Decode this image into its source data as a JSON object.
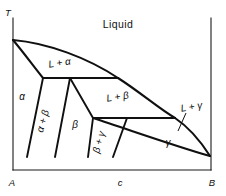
{
  "figure": {
    "kind": "binary-phase-diagram",
    "background_color": "#ffffff",
    "line_color": "#101010"
  },
  "axes": {
    "vertical_label": "T",
    "origin_label": "A",
    "right_label": "B",
    "mid_label": "c"
  },
  "regions": {
    "liquid": "Liquid",
    "liquid_alpha": "L + α",
    "liquid_beta": "L + β",
    "liquid_gamma": "L + γ",
    "alpha": "α",
    "beta": "β",
    "gamma": "γ",
    "alpha_beta": "α + β",
    "beta_gamma": "β + γ"
  }
}
